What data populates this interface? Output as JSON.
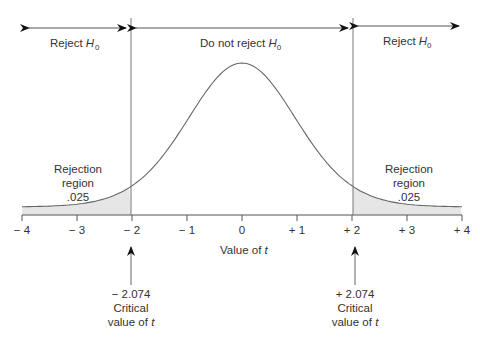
{
  "chart_data": {
    "type": "area",
    "title": "",
    "xlabel": "Value of t",
    "ylabel": "",
    "xlim": [
      -4,
      4
    ],
    "x_ticks": [
      "-4",
      "-3",
      "-2",
      "-1",
      "0",
      "+1",
      "+2",
      "+3",
      "+4"
    ],
    "distribution": "t-distribution (two-tailed test)",
    "critical_values": [
      -2.074,
      2.074
    ],
    "regions": [
      {
        "name": "Reject H0",
        "range": [
          -4,
          -2.074
        ]
      },
      {
        "name": "Do not reject H0",
        "range": [
          -2.074,
          2.074
        ]
      },
      {
        "name": "Reject H0",
        "range": [
          2.074,
          4
        ]
      }
    ],
    "rejection_region_area": [
      0.025,
      0.025
    ],
    "grid": false,
    "legend": "none"
  },
  "labels": {
    "reject_left": "Reject H",
    "reject_right": "Reject H",
    "do_not_reject": "Do not reject H",
    "h_subscript": "0",
    "rejection_left_1": "Rejection",
    "rejection_left_2": "region",
    "rejection_left_3": ".025",
    "rejection_right_1": "Rejection",
    "rejection_right_2": "region",
    "rejection_right_3": ".025",
    "xlabel_text": "Value of ",
    "xlabel_var": "t",
    "crit_left_value": "− 2.074",
    "crit_right_value": "+ 2.074",
    "crit_caption": "Critical",
    "crit_caption2": "value of ",
    "crit_var": "t"
  },
  "ticks": [
    {
      "label": "− 4",
      "x": 22
    },
    {
      "label": "− 3",
      "x": 77
    },
    {
      "label": "− 2",
      "x": 132
    },
    {
      "label": "− 1",
      "x": 187
    },
    {
      "label": "0",
      "x": 242
    },
    {
      "label": "+ 1",
      "x": 297
    },
    {
      "label": "+ 2",
      "x": 352
    },
    {
      "label": "+ 3",
      "x": 407
    },
    {
      "label": "+ 4",
      "x": 462
    }
  ]
}
